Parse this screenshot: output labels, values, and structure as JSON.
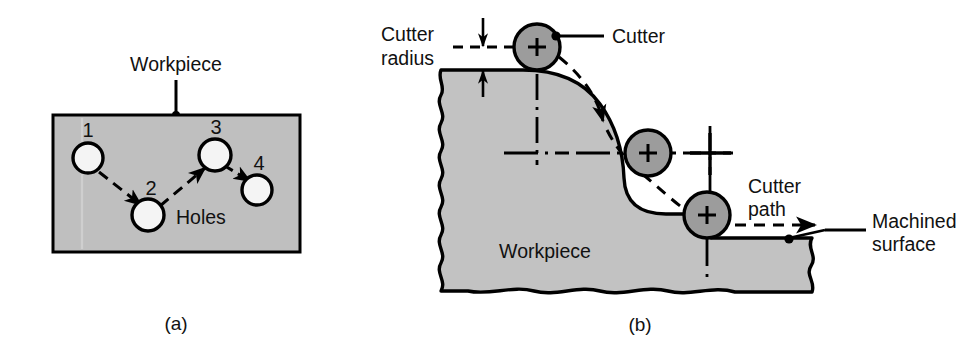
{
  "figure": {
    "kind": "engineering-diagram",
    "background_color": "#ffffff",
    "line_color": "#000000",
    "workpiece_fill_a": "#bfbfbf",
    "workpiece_fill_b": "#c2c2c2",
    "cutter_fill": "#9c9c9c",
    "hole_fill": "#f2f2f2"
  },
  "panel_a": {
    "caption": "(a)",
    "workpiece_label": "Workpiece",
    "holes_label": "Holes",
    "hole_numbers": [
      "1",
      "2",
      "3",
      "4"
    ],
    "holes": [
      {
        "id": "1",
        "cx": 88,
        "cy": 158,
        "r": 15
      },
      {
        "id": "2",
        "cx": 148,
        "cy": 215,
        "r": 16
      },
      {
        "id": "3",
        "cx": 215,
        "cy": 155,
        "r": 16
      },
      {
        "id": "4",
        "cx": 257,
        "cy": 190,
        "r": 15
      }
    ],
    "tool_path_order": [
      "1",
      "2",
      "3",
      "4"
    ],
    "plate": {
      "x": 53,
      "y": 115,
      "width": 247,
      "height": 137
    }
  },
  "panel_b": {
    "caption": "(b)",
    "workpiece_label": "Workpiece",
    "cutter_radius_label_line1": "Cutter",
    "cutter_radius_label_line2": "radius",
    "cutter_label": "Cutter",
    "cutter_path_label_line1": "Cutter",
    "cutter_path_label_line2": "path",
    "machined_surface_label_line1": "Machined",
    "machined_surface_label_line2": "surface",
    "cutters": [
      {
        "position": "top",
        "cx": 537,
        "cy": 47,
        "r": 23
      },
      {
        "position": "middle",
        "cx": 648,
        "cy": 153,
        "r": 23
      },
      {
        "position": "bottom",
        "cx": 707,
        "cy": 215,
        "r": 23
      }
    ],
    "center_marker": {
      "cx": 710,
      "cy": 153
    }
  }
}
